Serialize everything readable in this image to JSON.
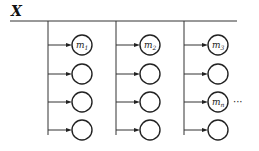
{
  "diagram": {
    "title": "X",
    "columns": [
      {
        "nodes": [
          {
            "label": "m",
            "sub": "1"
          },
          {
            "label": "",
            "sub": ""
          },
          {
            "label": "",
            "sub": ""
          },
          {
            "label": "",
            "sub": ""
          }
        ]
      },
      {
        "nodes": [
          {
            "label": "m",
            "sub": "2"
          },
          {
            "label": "",
            "sub": ""
          },
          {
            "label": "",
            "sub": ""
          },
          {
            "label": "",
            "sub": ""
          }
        ]
      },
      {
        "nodes": [
          {
            "label": "m",
            "sub": "3"
          },
          {
            "label": "",
            "sub": ""
          },
          {
            "label": "m",
            "sub": "n"
          },
          {
            "label": "",
            "sub": ""
          }
        ]
      }
    ],
    "continuation": "···",
    "continuation_row": 2
  }
}
